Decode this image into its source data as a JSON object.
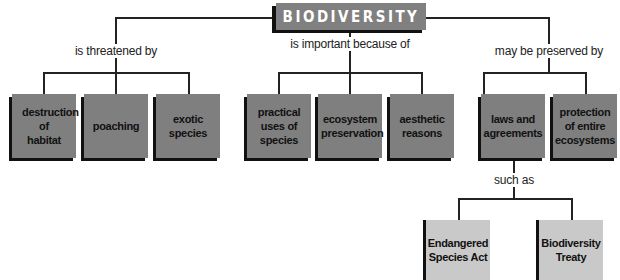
{
  "title": "BIODIVERSITY",
  "colors": {
    "title_fill": "#808080",
    "concept_fill": "#7f7f7f",
    "example_fill": "#c9c9c9",
    "shadow": "#111111",
    "line": "#222222"
  },
  "branches": [
    {
      "link_label": "is threatened by",
      "children": [
        {
          "label": "destruction of habitat"
        },
        {
          "label": "poaching"
        },
        {
          "label": "exotic species"
        }
      ]
    },
    {
      "link_label": "is important because of",
      "children": [
        {
          "label": "practical uses of species"
        },
        {
          "label": "ecosystem preservation"
        },
        {
          "label": "aesthetic reasons"
        }
      ]
    },
    {
      "link_label": "may be preserved by",
      "children": [
        {
          "label": "laws and agreements",
          "link_label": "such as",
          "children": [
            {
              "label": "Endangered Species Act"
            },
            {
              "label": "Biodiversity Treaty"
            }
          ]
        },
        {
          "label": "protection of entire ecosystems"
        }
      ]
    }
  ]
}
